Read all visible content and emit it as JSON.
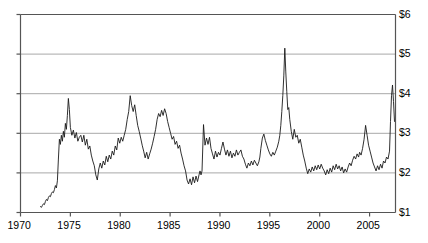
{
  "chart_data": {
    "type": "line",
    "title": "",
    "subtitle": "",
    "xlabel": "",
    "ylabel": "",
    "grid": true,
    "legend": "none",
    "xlim": [
      1970,
      2007.6
    ],
    "ylim": [
      1,
      6
    ],
    "xticks": [
      1970,
      1975,
      1980,
      1985,
      1990,
      1995,
      2000,
      2005
    ],
    "xticklabels": [
      "1970",
      "1975",
      "1980",
      "1985",
      "1990",
      "1995",
      "2000",
      "2005"
    ],
    "yticks": [
      1,
      2,
      3,
      4,
      5,
      6
    ],
    "yticklabels": [
      "$1",
      "$2",
      "$3",
      "$4",
      "$5",
      "$6"
    ],
    "ytick_side": "right",
    "line_color": "#1a1a1a",
    "grid_color": "#a8a8a8",
    "axis_color": "#555555",
    "series": [
      {
        "name": "price",
        "x": [
          1972.0,
          1972.1,
          1972.2,
          1972.3,
          1972.4,
          1972.5,
          1972.6,
          1972.7,
          1972.8,
          1972.9,
          1973.0,
          1973.1,
          1973.2,
          1973.3,
          1973.4,
          1973.5,
          1973.6,
          1973.7,
          1973.8,
          1973.9,
          1974.0,
          1974.1,
          1974.2,
          1974.3,
          1974.4,
          1974.5,
          1974.6,
          1974.7,
          1974.8,
          1974.9,
          1975.0,
          1975.15,
          1975.3,
          1975.45,
          1975.6,
          1975.75,
          1975.9,
          1976.05,
          1976.2,
          1976.35,
          1976.5,
          1976.65,
          1976.8,
          1976.95,
          1977.1,
          1977.25,
          1977.4,
          1977.55,
          1977.7,
          1977.85,
          1978.0,
          1978.15,
          1978.3,
          1978.45,
          1978.6,
          1978.75,
          1978.9,
          1979.05,
          1979.2,
          1979.35,
          1979.5,
          1979.65,
          1979.8,
          1979.95,
          1980.1,
          1980.25,
          1980.4,
          1980.55,
          1980.7,
          1980.85,
          1981.0,
          1981.15,
          1981.3,
          1981.45,
          1981.6,
          1981.75,
          1981.9,
          1982.05,
          1982.2,
          1982.35,
          1982.5,
          1982.65,
          1982.8,
          1982.95,
          1983.1,
          1983.25,
          1983.4,
          1983.55,
          1983.7,
          1983.85,
          1984.0,
          1984.15,
          1984.3,
          1984.45,
          1984.6,
          1984.75,
          1984.9,
          1985.05,
          1985.2,
          1985.35,
          1985.5,
          1985.65,
          1985.8,
          1985.95,
          1986.1,
          1986.25,
          1986.4,
          1986.55,
          1986.7,
          1986.85,
          1987.0,
          1987.15,
          1987.3,
          1987.45,
          1987.6,
          1987.75,
          1987.9,
          1988.0,
          1988.1,
          1988.2,
          1988.35,
          1988.5,
          1988.65,
          1988.8,
          1988.95,
          1989.1,
          1989.25,
          1989.4,
          1989.55,
          1989.7,
          1989.85,
          1990.0,
          1990.15,
          1990.3,
          1990.45,
          1990.6,
          1990.75,
          1990.9,
          1991.05,
          1991.2,
          1991.35,
          1991.5,
          1991.65,
          1991.8,
          1991.95,
          1992.1,
          1992.25,
          1992.4,
          1992.55,
          1992.7,
          1992.85,
          1993.0,
          1993.15,
          1993.3,
          1993.45,
          1993.6,
          1993.75,
          1993.9,
          1994.0,
          1994.1,
          1994.25,
          1994.4,
          1994.55,
          1994.7,
          1994.85,
          1995.0,
          1995.15,
          1995.3,
          1995.45,
          1995.6,
          1995.75,
          1995.9,
          1996.0,
          1996.1,
          1996.2,
          1996.3,
          1996.4,
          1996.5,
          1996.6,
          1996.7,
          1996.8,
          1996.9,
          1997.0,
          1997.15,
          1997.3,
          1997.45,
          1997.6,
          1997.75,
          1997.9,
          1998.05,
          1998.2,
          1998.35,
          1998.5,
          1998.65,
          1998.8,
          1998.95,
          1999.1,
          1999.25,
          1999.4,
          1999.55,
          1999.7,
          1999.85,
          2000.0,
          2000.15,
          2000.3,
          2000.45,
          2000.6,
          2000.75,
          2000.9,
          2001.05,
          2001.2,
          2001.35,
          2001.5,
          2001.65,
          2001.8,
          2001.95,
          2002.1,
          2002.25,
          2002.4,
          2002.55,
          2002.7,
          2002.85,
          2003.0,
          2003.15,
          2003.3,
          2003.45,
          2003.6,
          2003.75,
          2003.9,
          2004.0,
          2004.15,
          2004.3,
          2004.45,
          2004.6,
          2004.75,
          2004.9,
          2005.05,
          2005.2,
          2005.35,
          2005.5,
          2005.65,
          2005.8,
          2005.95,
          2006.1,
          2006.25,
          2006.4,
          2006.55,
          2006.7,
          2006.85,
          2007.0,
          2007.1,
          2007.2,
          2007.3,
          2007.4,
          2007.5
        ],
        "y": [
          1.15,
          1.13,
          1.18,
          1.22,
          1.2,
          1.28,
          1.33,
          1.3,
          1.38,
          1.42,
          1.4,
          1.48,
          1.52,
          1.5,
          1.58,
          1.68,
          1.62,
          1.8,
          2.35,
          2.85,
          2.72,
          2.95,
          2.8,
          3.05,
          2.9,
          3.25,
          3.1,
          3.45,
          3.88,
          3.6,
          3.15,
          2.95,
          3.08,
          2.88,
          3.02,
          2.8,
          2.9,
          2.95,
          2.78,
          2.95,
          2.7,
          2.85,
          2.6,
          2.68,
          2.45,
          2.3,
          2.18,
          1.95,
          1.82,
          2.1,
          2.25,
          2.12,
          2.3,
          2.2,
          2.42,
          2.28,
          2.45,
          2.35,
          2.55,
          2.45,
          2.68,
          2.58,
          2.88,
          2.75,
          2.9,
          2.8,
          2.95,
          3.1,
          3.35,
          3.55,
          3.95,
          3.7,
          3.55,
          3.72,
          3.45,
          3.2,
          3.05,
          2.88,
          2.7,
          2.55,
          2.38,
          2.52,
          2.35,
          2.48,
          2.6,
          2.75,
          2.92,
          3.1,
          3.35,
          3.5,
          3.42,
          3.58,
          3.45,
          3.62,
          3.5,
          3.3,
          3.15,
          3.0,
          2.85,
          2.92,
          2.72,
          2.8,
          2.62,
          2.7,
          2.5,
          2.35,
          2.18,
          2.05,
          1.82,
          1.72,
          1.85,
          1.7,
          1.9,
          1.75,
          1.92,
          1.78,
          1.95,
          2.05,
          1.95,
          2.05,
          3.22,
          2.7,
          2.88,
          2.72,
          2.9,
          2.62,
          2.48,
          2.35,
          2.55,
          2.4,
          2.52,
          2.45,
          2.62,
          2.78,
          2.6,
          2.45,
          2.58,
          2.42,
          2.55,
          2.38,
          2.5,
          2.42,
          2.58,
          2.45,
          2.52,
          2.58,
          2.42,
          2.35,
          2.22,
          2.12,
          2.25,
          2.18,
          2.3,
          2.2,
          2.32,
          2.25,
          2.18,
          2.28,
          2.4,
          2.62,
          2.88,
          2.98,
          2.82,
          2.7,
          2.58,
          2.48,
          2.42,
          2.52,
          2.45,
          2.55,
          2.65,
          2.8,
          2.95,
          3.2,
          3.55,
          3.95,
          4.45,
          5.15,
          4.55,
          4.05,
          3.6,
          3.65,
          3.35,
          3.05,
          2.85,
          3.1,
          2.9,
          2.95,
          2.75,
          2.85,
          2.65,
          2.45,
          2.3,
          2.12,
          1.98,
          2.1,
          2.02,
          2.15,
          2.05,
          2.18,
          2.08,
          2.2,
          2.1,
          2.22,
          2.12,
          2.05,
          1.95,
          2.08,
          1.98,
          2.12,
          2.02,
          2.18,
          2.08,
          2.22,
          2.1,
          2.18,
          2.05,
          2.15,
          2.0,
          2.1,
          2.02,
          2.15,
          2.25,
          2.18,
          2.32,
          2.42,
          2.35,
          2.48,
          2.4,
          2.52,
          2.45,
          2.62,
          2.85,
          3.2,
          2.95,
          2.7,
          2.55,
          2.4,
          2.25,
          2.15,
          2.05,
          2.18,
          2.08,
          2.22,
          2.12,
          2.3,
          2.25,
          2.4,
          2.35,
          2.55,
          3.3,
          3.95,
          4.22,
          3.8,
          3.3
        ]
      }
    ]
  },
  "axes": {
    "y_labels": [
      "$6",
      "$5",
      "$4",
      "$3",
      "$2",
      "$1"
    ],
    "x_labels": [
      "1970",
      "1975",
      "1980",
      "1985",
      "1990",
      "1995",
      "2000",
      "2005"
    ]
  }
}
